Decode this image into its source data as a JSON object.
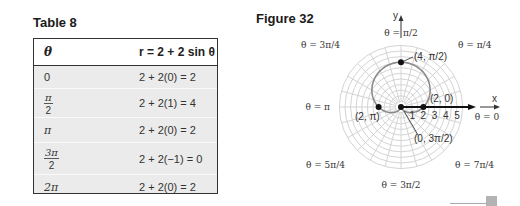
{
  "table": {
    "caption": "Table 8",
    "headers": [
      "θ",
      "r = 2 + 2 sin θ"
    ],
    "rows": [
      {
        "theta": {
          "text": "0"
        },
        "r": "2 + 2(0) = 2"
      },
      {
        "theta": {
          "num": "π",
          "den": "2"
        },
        "r": "2 + 2(1) = 4"
      },
      {
        "theta": {
          "text": "π"
        },
        "r": "2 + 2(0) = 2"
      },
      {
        "theta": {
          "num": "3π",
          "den": "2"
        },
        "r": "2 + 2(−1) = 0"
      },
      {
        "theta": {
          "text": "2π"
        },
        "r": "2 + 2(0) = 2"
      }
    ]
  },
  "chart_data": {
    "type": "line",
    "title": "Figure 32",
    "coordinate_system": "polar",
    "equation": "r = 2 + 2 sin θ",
    "xlabel": "x",
    "ylabel": "y",
    "radial_ticks": [
      "1",
      "2",
      "3",
      "4",
      "5"
    ],
    "r_max_grid": 5.5,
    "angle_grid_step": "π/12",
    "angle_labels": [
      {
        "angle": 0,
        "text": "θ = 0"
      },
      {
        "angle": 45,
        "text": "θ = π/4"
      },
      {
        "angle": 90,
        "text": "θ = π/2"
      },
      {
        "angle": 135,
        "text": "θ = 3π/4"
      },
      {
        "angle": 180,
        "text": "θ = π"
      },
      {
        "angle": 225,
        "text": "θ = 5π/4"
      },
      {
        "angle": 270,
        "text": "θ = 3π/2"
      },
      {
        "angle": 315,
        "text": "θ = 7π/4"
      }
    ],
    "points": [
      {
        "r": 4,
        "theta_deg": 90,
        "label": "(4, π/2)"
      },
      {
        "r": 2,
        "theta_deg": 0,
        "label": "(2, 0)"
      },
      {
        "r": 2,
        "theta_deg": 180,
        "label": "(2, π)"
      },
      {
        "r": 0,
        "theta_deg": 270,
        "label": "(0, 3π/2)"
      }
    ],
    "colors": {
      "curve": "#8a8a8a",
      "grid": "#d4d4d4",
      "axis": "#111111",
      "point": "#111111"
    }
  }
}
